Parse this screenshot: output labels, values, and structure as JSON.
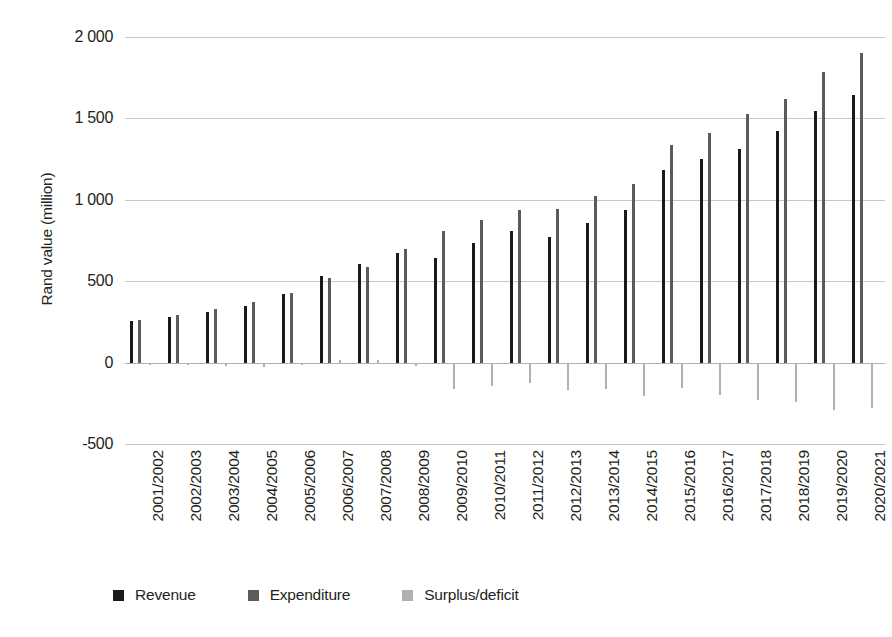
{
  "chart_data": {
    "type": "bar",
    "title": "",
    "subtitle": "",
    "xlabel": "",
    "ylabel": "Rand value (million)",
    "ylim": [
      -500,
      2000
    ],
    "yticks": [
      -500,
      0,
      500,
      1000,
      1500,
      2000
    ],
    "ytick_labels": [
      "-500",
      "0",
      "500",
      "1 000",
      "1 500",
      "2 000"
    ],
    "grid": true,
    "legend_position": "bottom-left",
    "categories": [
      "2001/2002",
      "2002/2003",
      "2003/2004",
      "2004/2005",
      "2005/2006",
      "2006/2007",
      "2007/2008",
      "2008/2009",
      "2009/2010",
      "2010/2011",
      "2011/2012",
      "2012/2013",
      "2013/2014",
      "2014/2015",
      "2015/2016",
      "2016/2017",
      "2017/2018",
      "2018/2019",
      "2019/2020",
      "2020/2021"
    ],
    "series": [
      {
        "name": "Revenue",
        "color": "#1a1a1a",
        "values": [
          255,
          283,
          308,
          350,
          424,
          533,
          608,
          676,
          645,
          737,
          808,
          772,
          858,
          935,
          1181,
          1250,
          1315,
          1420,
          1545,
          1645
        ]
      },
      {
        "name": "Expenditure",
        "color": "#5b5b5b",
        "values": [
          264,
          290,
          330,
          375,
          428,
          520,
          590,
          695,
          810,
          878,
          935,
          943,
          1022,
          1100,
          1334,
          1408,
          1525,
          1622,
          1782,
          1900
        ]
      },
      {
        "name": "Surplus/deficit",
        "color": "#b0b0b0",
        "values": [
          -9,
          -7,
          -22,
          -25,
          -4,
          13,
          18,
          -19,
          -165,
          -141,
          -127,
          -171,
          -164,
          -205,
          -153,
          -198,
          -232,
          -243,
          -290,
          -280
        ]
      }
    ]
  },
  "legend": {
    "items": [
      {
        "label": "Revenue",
        "color": "#1a1a1a"
      },
      {
        "label": "Expenditure",
        "color": "#5b5b5b"
      },
      {
        "label": "Surplus/deficit",
        "color": "#b0b0b0"
      }
    ]
  },
  "colors": {
    "revenue": "#1a1a1a",
    "expenditure": "#5b5b5b",
    "surplus_deficit": "#b0b0b0",
    "gridline": "#c9c6c4",
    "text": "#231f20",
    "background": "#ffffff"
  }
}
